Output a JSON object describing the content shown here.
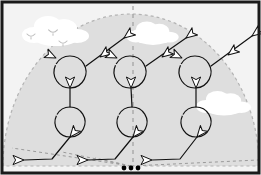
{
  "diagram": {
    "type": "aerobatic-figure-diagram",
    "colors": {
      "border": "#1a1a1a",
      "outside_sky": "#f3f3f3",
      "inside_dome": "#dedede",
      "dome_edge": "#b3b3b3",
      "centerline": "#9a9a9a",
      "flight_path": "#111111",
      "cloud": "#ffffff",
      "bird": "#bdbdbd",
      "center_marker": "#000000"
    },
    "canvas": {
      "width": 261,
      "height": 175
    },
    "border": {
      "outer_inset": 2,
      "stroke_width": 3
    },
    "dome": {
      "label": "aerobatic box dome",
      "center_x": 131,
      "base_y": 166,
      "radius_x": 128,
      "radius_y": 152,
      "dash": "3,3"
    },
    "centerline": {
      "label": "box centerline",
      "x": 133,
      "y1": 6,
      "y2": 166,
      "dash": "4,4"
    },
    "center_marker": {
      "label": "box center judge marker",
      "dots": [
        {
          "cx": 124,
          "cy": 168,
          "r": 2.4
        },
        {
          "cx": 131,
          "cy": 168,
          "r": 2.4
        },
        {
          "cx": 138,
          "cy": 168,
          "r": 2.4
        }
      ]
    },
    "ground_lines": [
      {
        "label": "left outer box line",
        "x1": 131,
        "y1": 166,
        "x2": 12,
        "y2": 148
      },
      {
        "label": "left inner box line",
        "x1": 131,
        "y1": 166,
        "x2": 62,
        "y2": 152
      },
      {
        "label": "right inner box line",
        "x1": 131,
        "y1": 166,
        "x2": 95,
        "y2": 158
      },
      {
        "label": "right outer box line",
        "x1": 131,
        "y1": 166,
        "x2": 258,
        "y2": 160
      }
    ],
    "clouds": [
      {
        "name": "cloud-top-left",
        "cx": 56,
        "cy": 32,
        "scale": 1.0
      },
      {
        "name": "cloud-top-center",
        "cx": 153,
        "cy": 34,
        "scale": 0.78
      },
      {
        "name": "cloud-right",
        "cx": 224,
        "cy": 104,
        "scale": 0.82
      }
    ],
    "birds": [
      {
        "name": "bird-1",
        "cx": 31,
        "cy": 36,
        "scale": 1.0
      },
      {
        "name": "bird-2",
        "cx": 53,
        "cy": 32,
        "scale": 1.1
      },
      {
        "name": "bird-3",
        "cx": 63,
        "cy": 43,
        "scale": 1.0
      }
    ],
    "loops": [
      {
        "name": "loop-upper-left",
        "cx": 70,
        "cy": 72,
        "r": 16
      },
      {
        "name": "loop-upper-center",
        "cx": 130,
        "cy": 72,
        "r": 16
      },
      {
        "name": "loop-upper-right",
        "cx": 195,
        "cy": 72,
        "r": 16
      },
      {
        "name": "loop-lower-left",
        "cx": 70,
        "cy": 122,
        "r": 15
      },
      {
        "name": "loop-lower-center",
        "cx": 132,
        "cy": 122,
        "r": 15
      },
      {
        "name": "loop-lower-right",
        "cx": 196,
        "cy": 122,
        "r": 15
      }
    ],
    "flight_segments": [
      {
        "name": "entry-left",
        "d": "M 24,160 L 52,159 L 70,137"
      },
      {
        "name": "climb-left",
        "d": "M 70,107 L 70,88"
      },
      {
        "name": "exit-left",
        "d": "M 86,66 L 124,38"
      },
      {
        "name": "entry-center",
        "d": "M 88,160 L 115,159 L 133,137"
      },
      {
        "name": "climb-center",
        "d": "M 132,107 L 131,88"
      },
      {
        "name": "exit-center",
        "d": "M 146,66 L 186,38"
      },
      {
        "name": "entry-right",
        "d": "M 152,160 L 180,159 L 197,137"
      },
      {
        "name": "climb-right",
        "d": "M 196,107 L 196,88"
      },
      {
        "name": "exit-right",
        "d": "M 211,66 L 252,36"
      }
    ],
    "arrowheads": [
      {
        "name": "arrow-entry-left-tip",
        "x": 24,
        "y": 160,
        "angle": 180
      },
      {
        "name": "arrow-entry-left-mid",
        "x": 70,
        "y": 137,
        "angle": 309
      },
      {
        "name": "arrow-climb-left",
        "x": 70,
        "y": 88,
        "angle": 270
      },
      {
        "name": "arrow-loop-left-top",
        "x": 56,
        "y": 58,
        "angle": 205
      },
      {
        "name": "arrow-exit-left-mid",
        "x": 100,
        "y": 57,
        "angle": 323
      },
      {
        "name": "arrow-exit-left-tip",
        "x": 124,
        "y": 38,
        "angle": 323
      },
      {
        "name": "arrow-entry-center-tip",
        "x": 88,
        "y": 160,
        "angle": 180
      },
      {
        "name": "arrow-entry-center-mid",
        "x": 133,
        "y": 137,
        "angle": 309
      },
      {
        "name": "arrow-climb-center",
        "x": 131,
        "y": 88,
        "angle": 270
      },
      {
        "name": "arrow-loop-center-top",
        "x": 117,
        "y": 58,
        "angle": 205
      },
      {
        "name": "arrow-exit-center-mid",
        "x": 162,
        "y": 57,
        "angle": 323
      },
      {
        "name": "arrow-exit-center-tip",
        "x": 186,
        "y": 38,
        "angle": 323
      },
      {
        "name": "arrow-entry-right-tip",
        "x": 152,
        "y": 160,
        "angle": 180
      },
      {
        "name": "arrow-entry-right-mid",
        "x": 197,
        "y": 137,
        "angle": 309
      },
      {
        "name": "arrow-climb-right",
        "x": 196,
        "y": 88,
        "angle": 270
      },
      {
        "name": "arrow-loop-right-top",
        "x": 182,
        "y": 58,
        "angle": 205
      },
      {
        "name": "arrow-exit-right-mid",
        "x": 228,
        "y": 55,
        "angle": 323
      },
      {
        "name": "arrow-exit-right-tip",
        "x": 252,
        "y": 36,
        "angle": 323
      }
    ]
  }
}
